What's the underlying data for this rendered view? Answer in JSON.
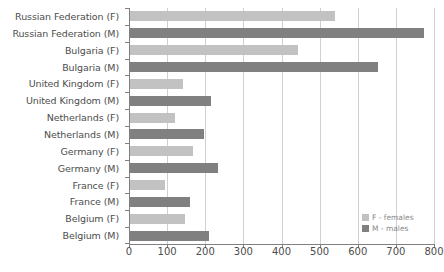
{
  "chart_data": {
    "type": "bar",
    "orientation": "horizontal",
    "title": "",
    "xlabel": "",
    "ylabel": "",
    "xlim": [
      0,
      800
    ],
    "grid": true,
    "legend_position": "bottom-right",
    "xticks": [
      "0",
      "100",
      "200",
      "300",
      "400",
      "500",
      "600",
      "700",
      "800"
    ],
    "xtick_values": [
      0,
      100,
      200,
      300,
      400,
      500,
      600,
      700,
      800
    ],
    "categories": [
      "Russian Federation (F)",
      "Russian Federation (M)",
      "Bulgaria (F)",
      "Bulgaria (M)",
      "United Kingdom (F)",
      "United Kingdom (M)",
      "Netherlands (F)",
      "Netherlands (M)",
      "Germany (F)",
      "Germany (M)",
      "France (F)",
      "France (M)",
      "Belgium (F)",
      "Belgium (M)"
    ],
    "values": [
      538,
      771,
      440,
      651,
      140,
      213,
      118,
      193,
      164,
      232,
      91,
      158,
      144,
      206
    ],
    "sexes": [
      "F",
      "M",
      "F",
      "M",
      "F",
      "M",
      "F",
      "M",
      "F",
      "M",
      "F",
      "M",
      "F",
      "M"
    ],
    "bars": [
      {
        "label": "Russian Federation (F)",
        "sex": "F",
        "value": 538
      },
      {
        "label": "Russian Federation (M)",
        "sex": "M",
        "value": 771
      },
      {
        "label": "Bulgaria (F)",
        "sex": "F",
        "value": 440
      },
      {
        "label": "Bulgaria (M)",
        "sex": "M",
        "value": 651
      },
      {
        "label": "United Kingdom (F)",
        "sex": "F",
        "value": 140
      },
      {
        "label": "United Kingdom (M)",
        "sex": "M",
        "value": 213
      },
      {
        "label": "Netherlands (F)",
        "sex": "F",
        "value": 118
      },
      {
        "label": "Netherlands (M)",
        "sex": "M",
        "value": 193
      },
      {
        "label": "Germany (F)",
        "sex": "F",
        "value": 164
      },
      {
        "label": "Germany (M)",
        "sex": "M",
        "value": 232
      },
      {
        "label": "France (F)",
        "sex": "F",
        "value": 91
      },
      {
        "label": "France (M)",
        "sex": "M",
        "value": 158
      },
      {
        "label": "Belgium (F)",
        "sex": "F",
        "value": 144
      },
      {
        "label": "Belgium (M)",
        "sex": "M",
        "value": 206
      }
    ],
    "legend": [
      {
        "key": "F",
        "label": "F - females",
        "color": "#c2c2c2"
      },
      {
        "key": "M",
        "label": "M - males",
        "color": "#808080"
      }
    ],
    "colors": {
      "female": "#c2c2c2",
      "male": "#808080",
      "grid": "#d0d0d0",
      "axis": "#808080",
      "text": "#4d4d4d",
      "legend_text": "#8a8a8a",
      "background": "#ffffff"
    }
  }
}
